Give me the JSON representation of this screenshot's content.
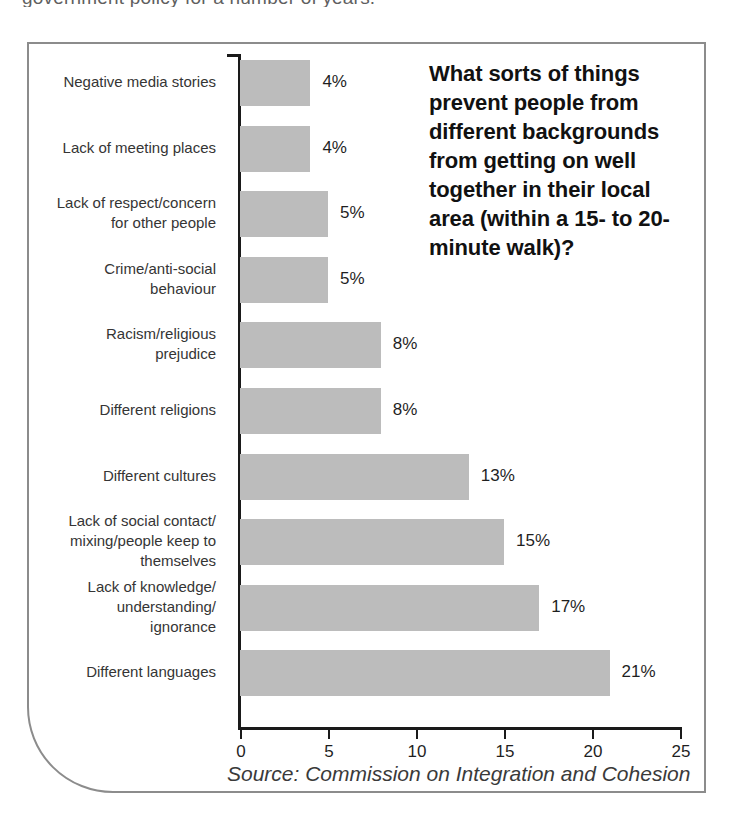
{
  "page": {
    "cropped_body_text": "government policy for a number of years."
  },
  "figure": {
    "title": "What sorts of things prevent people from different backgrounds from getting on well together in their local area (within a 15- to 20-minute walk)?",
    "source": "Source: Commission on Integration and Cohesion",
    "bar_color": "#bcbcbc",
    "axis_color": "#1a1a1a",
    "frame_color": "#8c8c8c"
  },
  "chart_data": {
    "type": "bar",
    "orientation": "horizontal",
    "title": "What sorts of things prevent people from different backgrounds from getting on well together in their local area (within a 15- to 20-minute walk)?",
    "xlabel": "",
    "ylabel": "",
    "xlim": [
      0,
      25
    ],
    "xticks": [
      0,
      5,
      10,
      15,
      20,
      25
    ],
    "xtick_labels": [
      "0",
      "5",
      "10",
      "15",
      "20",
      "25"
    ],
    "grid": false,
    "legend": false,
    "value_suffix": "%",
    "source": "Source: Commission on Integration and Cohesion",
    "categories": [
      "Negative media stories",
      "Lack of meeting places",
      "Lack of respect/concern\nfor other people",
      "Crime/anti-social\nbehaviour",
      "Racism/religious\nprejudice",
      "Different religions",
      "Different cultures",
      "Lack of social contact/\nmixing/people keep to\nthemselves",
      "Lack of knowledge/\nunderstanding/\nignorance",
      "Different languages"
    ],
    "values": [
      4,
      4,
      5,
      5,
      8,
      8,
      13,
      15,
      17,
      21
    ],
    "value_labels": [
      "4%",
      "4%",
      "5%",
      "5%",
      "8%",
      "8%",
      "13%",
      "15%",
      "17%",
      "21%"
    ]
  }
}
